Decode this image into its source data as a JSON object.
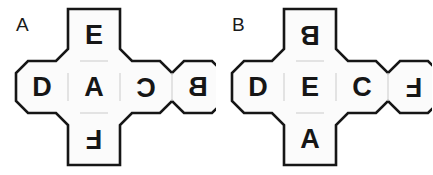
{
  "page": {
    "background_color": "#ffffff",
    "stroke_color": "#161616",
    "fill_color": "#fbfbfb",
    "inner_line_color": "#d9d9d9",
    "text_color": "#161616"
  },
  "figures": [
    {
      "id": "figure-a",
      "label": "A",
      "label_x": 22,
      "label_y": 32,
      "cells": [
        {
          "name": "top-face",
          "letter": "E",
          "rotation": 0,
          "mirrored": false,
          "col": 1,
          "row": 0
        },
        {
          "name": "left-face",
          "letter": "D",
          "rotation": 0,
          "mirrored": false,
          "col": 0,
          "row": 1
        },
        {
          "name": "center-face",
          "letter": "A",
          "rotation": 0,
          "mirrored": false,
          "col": 1,
          "row": 1
        },
        {
          "name": "right-face",
          "letter": "C",
          "rotation": 180,
          "mirrored": false,
          "col": 2,
          "row": 1
        },
        {
          "name": "far-right-face",
          "letter": "B",
          "rotation": 0,
          "mirrored": true,
          "col": 3,
          "row": 1
        },
        {
          "name": "bottom-face",
          "letter": "F",
          "rotation": 180,
          "mirrored": false,
          "col": 1,
          "row": 2
        }
      ]
    },
    {
      "id": "figure-b",
      "label": "B",
      "label_x": 22,
      "label_y": 32,
      "cells": [
        {
          "name": "top-face",
          "letter": "B",
          "rotation": 180,
          "mirrored": false,
          "col": 1,
          "row": 0
        },
        {
          "name": "left-face",
          "letter": "D",
          "rotation": 0,
          "mirrored": false,
          "col": 0,
          "row": 1
        },
        {
          "name": "center-face",
          "letter": "E",
          "rotation": 0,
          "mirrored": false,
          "col": 1,
          "row": 1
        },
        {
          "name": "right-face",
          "letter": "C",
          "rotation": 0,
          "mirrored": false,
          "col": 2,
          "row": 1
        },
        {
          "name": "far-right-face",
          "letter": "F",
          "rotation": 180,
          "mirrored": false,
          "col": 3,
          "row": 1
        },
        {
          "name": "bottom-face",
          "letter": "A",
          "rotation": 0,
          "mirrored": false,
          "col": 1,
          "row": 2
        }
      ]
    }
  ],
  "geometry": {
    "cell_size": 52,
    "corner_cut": 12,
    "origin_x": 16,
    "origin_y": 9,
    "stroke_width": 2.6
  }
}
